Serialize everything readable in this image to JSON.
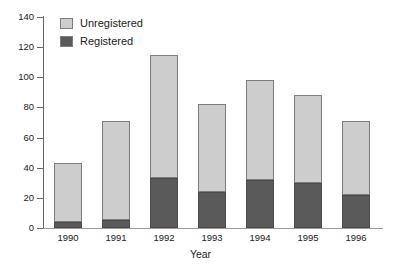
{
  "chart_data": {
    "type": "bar",
    "subtype": "stacked",
    "title": "",
    "xlabel": "Year",
    "ylabel": "",
    "categories": [
      "1990",
      "1991",
      "1992",
      "1993",
      "1994",
      "1995",
      "1996"
    ],
    "series": [
      {
        "name": "Registered",
        "values": [
          4,
          5,
          33,
          24,
          32,
          30,
          22
        ],
        "color": "#5a5a5a"
      },
      {
        "name": "Unregistered",
        "values": [
          39,
          66,
          82,
          58,
          66,
          58,
          49
        ],
        "color": "#cdcdcd"
      }
    ],
    "totals": [
      43,
      71,
      115,
      82,
      98,
      88,
      71
    ],
    "ylim": [
      0,
      140
    ],
    "yticks": [
      0,
      20,
      40,
      60,
      80,
      100,
      120,
      140
    ],
    "ytick_labels": [
      "0",
      "20",
      "40",
      "60",
      "80",
      "100",
      "120",
      "140"
    ],
    "grid": false,
    "legend_position": "top-left",
    "legend_entries": [
      "Unregistered",
      "Registered"
    ]
  },
  "axes": {
    "x_title": "Year"
  },
  "legend": {
    "items": [
      {
        "label": "Unregistered",
        "color": "#cdcdcd"
      },
      {
        "label": "Registered",
        "color": "#5a5a5a"
      }
    ]
  },
  "colors": {
    "unregistered": "#cdcdcd",
    "registered": "#5a5a5a",
    "axis": "#666666",
    "text": "#1a1a1a",
    "background": "#ffffff"
  }
}
